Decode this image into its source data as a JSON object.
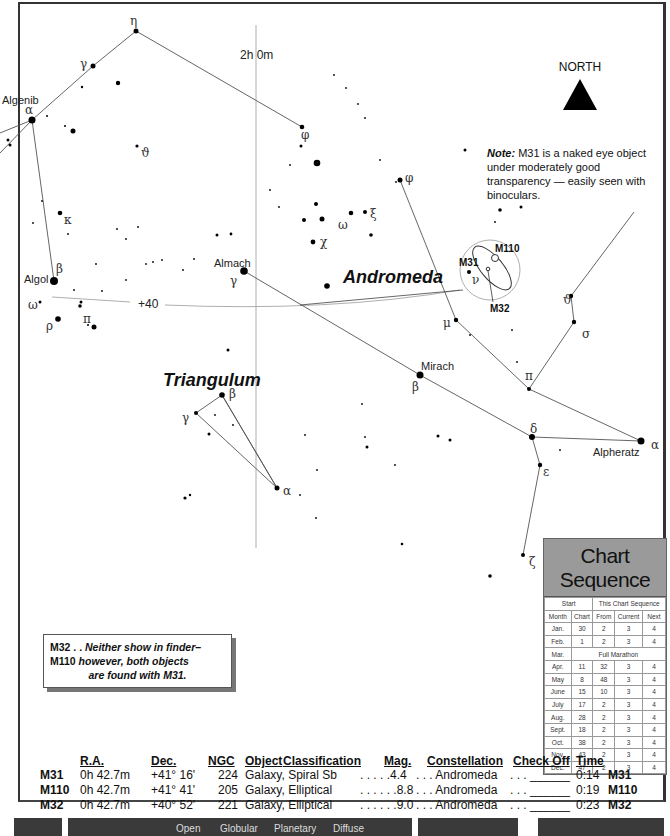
{
  "chart": {
    "ra_label": "2h 0m",
    "dec_label": "+40",
    "north_label": "NORTH",
    "constellations": [
      "Andromeda",
      "Triangulum"
    ],
    "star_labels": {
      "algenib": "Algenib",
      "algol": "Algol",
      "almach": "Almach",
      "mirach": "Mirach",
      "alpheratz": "Alpheratz"
    },
    "greek": {
      "eta": "η",
      "gamma": "γ",
      "alpha": "α",
      "theta": "ϑ",
      "phi": "φ",
      "kappa": "κ",
      "beta": "β",
      "omega": "ω",
      "rho": "ρ",
      "pi": "π",
      "chi": "χ",
      "xi": "ξ",
      "mu": "μ",
      "nu": "ν",
      "sigma": "σ",
      "delta": "δ",
      "epsilon": "ε",
      "zeta": "ζ"
    },
    "objects": {
      "m31": "M31",
      "m110": "M110",
      "m32": "M32"
    }
  },
  "note": {
    "lead": "Note:",
    "text": " M31 is a naked eye object under moderately good transparency — easily seen with binoculars."
  },
  "finder_note": {
    "line1_obj": "M32 . . ",
    "line1_text": "Neither show in finder–",
    "line2_obj": "M110 ",
    "line2_text": " however, both objects",
    "line3_text": "are found with M31."
  },
  "chart_sequence": {
    "title": "Chart Sequence",
    "group_headers": [
      "Start",
      "This Chart Sequence"
    ],
    "columns": [
      "Month",
      "Chart",
      "From",
      "Current",
      "Next"
    ],
    "rows": [
      [
        "Jan.",
        "30",
        "2",
        "3",
        "4"
      ],
      [
        "Feb.",
        "1",
        "2",
        "3",
        "4"
      ],
      [
        "Mar.",
        "Full Marathon"
      ],
      [
        "Apr.",
        "11",
        "32",
        "3",
        "4"
      ],
      [
        "May",
        "8",
        "48",
        "3",
        "4"
      ],
      [
        "June",
        "15",
        "10",
        "3",
        "4"
      ],
      [
        "July",
        "17",
        "2",
        "3",
        "4"
      ],
      [
        "Aug.",
        "28",
        "2",
        "3",
        "4"
      ],
      [
        "Sept.",
        "18",
        "2",
        "3",
        "4"
      ],
      [
        "Oct.",
        "38",
        "2",
        "3",
        "4"
      ],
      [
        "Nov.",
        "43",
        "2",
        "3",
        "4"
      ],
      [
        "Dec.",
        "47",
        "2",
        "3",
        "4"
      ]
    ]
  },
  "object_table": {
    "headers": [
      "R.A.",
      "Dec.",
      "NGC",
      "Object",
      "Classification",
      "Mag.",
      "Constellation",
      "Check Off",
      "Time"
    ],
    "rows": [
      {
        "id": "M31",
        "ra": "0h 42.7m",
        "dec": "+41° 16'",
        "ngc": "224",
        "cls": "Galaxy, Spiral Sb",
        "mag": ". . . . .4.4",
        "con": ". . . Andromeda",
        "chk": ". . . ______",
        "time": "0:14",
        "tag": "M31"
      },
      {
        "id": "M110",
        "ra": "0h 42.7m",
        "dec": "+41° 41'",
        "ngc": "205",
        "cls": "Galaxy, Elliptical",
        "mag": ". . . . . .8.8",
        "con": ". . . Andromeda",
        "chk": ". . . ______",
        "time": "0:19",
        "tag": "M110"
      },
      {
        "id": "M32",
        "ra": "0h 42.7m",
        "dec": "+40° 52'",
        "ngc": "221",
        "cls": "Galaxy, Elliptical",
        "mag": ". . . . . .9.0",
        "con": ". . . Andromeda",
        "chk": ". . . ______",
        "time": "0:23",
        "tag": "M32"
      }
    ]
  },
  "footer": {
    "labels": [
      "Open",
      "Globular",
      "Planetary",
      "Diffuse"
    ]
  }
}
